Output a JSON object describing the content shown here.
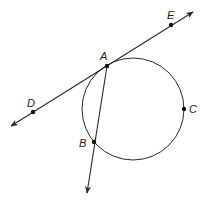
{
  "diagram": {
    "type": "geometry",
    "circle": {
      "cx": 133,
      "cy": 109,
      "r": 51
    },
    "points": [
      {
        "id": "A",
        "label": "A",
        "x": 107,
        "y": 66,
        "lx": 100,
        "ly": 60
      },
      {
        "id": "B",
        "label": "B",
        "x": 94,
        "y": 142,
        "lx": 79,
        "ly": 147
      },
      {
        "id": "C",
        "label": "C",
        "x": 184,
        "y": 109,
        "lx": 189,
        "ly": 113
      },
      {
        "id": "D",
        "label": "D",
        "x": 33,
        "y": 112,
        "lx": 27,
        "ly": 107
      },
      {
        "id": "E",
        "label": "E",
        "x": 171,
        "y": 25,
        "lx": 167,
        "ly": 19
      }
    ],
    "lines": [
      {
        "id": "tangent-DE",
        "x1": 11,
        "y1": 126,
        "x2": 193,
        "y2": 12,
        "arrows": "both"
      },
      {
        "id": "ray-AB",
        "x1": 107,
        "y1": 66,
        "x2": 87,
        "y2": 193,
        "arrows": "end"
      }
    ],
    "colors": {
      "stroke": "#2a2a2a",
      "point": "#111111",
      "background": "#ffffff"
    }
  }
}
